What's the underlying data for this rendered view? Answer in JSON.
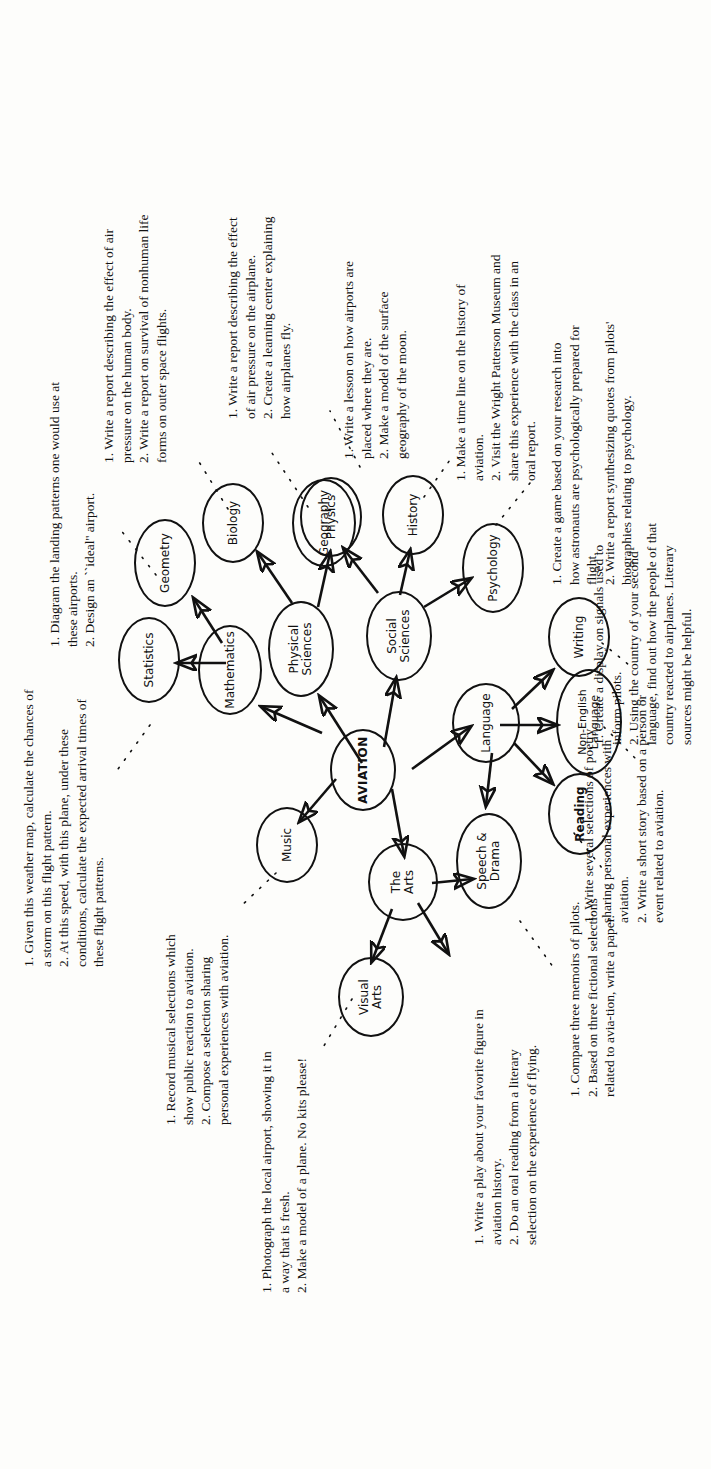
{
  "diagram": {
    "type": "concept-map",
    "title": "AVIATION",
    "center_node": "AVIATION",
    "nodes": [
      {
        "id": "aviation",
        "label": "AVIATION",
        "level": "center"
      },
      {
        "id": "the-arts",
        "label": "The\nArts",
        "level": "major"
      },
      {
        "id": "language",
        "label": "Language",
        "level": "major"
      },
      {
        "id": "social-sciences",
        "label": "Social\nSciences",
        "level": "major"
      },
      {
        "id": "physical-sciences",
        "label": "Physical\nSciences",
        "level": "major"
      },
      {
        "id": "mathematics",
        "label": "Mathematics",
        "level": "major"
      },
      {
        "id": "music",
        "label": "Music",
        "level": "leaf"
      },
      {
        "id": "visual-arts",
        "label": "Visual\nArts",
        "level": "leaf"
      },
      {
        "id": "speech-drama",
        "label": "Speech &\nDrama",
        "level": "leaf"
      },
      {
        "id": "reading",
        "label": "Reading",
        "level": "leaf"
      },
      {
        "id": "writing",
        "label": "Writing",
        "level": "leaf"
      },
      {
        "id": "non-english",
        "label": "Non-English\nLanguage",
        "level": "leaf"
      },
      {
        "id": "psychology",
        "label": "Psychology",
        "level": "leaf"
      },
      {
        "id": "history",
        "label": "History",
        "level": "leaf"
      },
      {
        "id": "geography",
        "label": "Geography",
        "level": "leaf"
      },
      {
        "id": "biology",
        "label": "Biology",
        "level": "leaf"
      },
      {
        "id": "physics",
        "label": "Physics",
        "level": "leaf"
      },
      {
        "id": "statistics",
        "label": "Statistics",
        "level": "leaf"
      },
      {
        "id": "geometry",
        "label": "Geometry",
        "level": "leaf"
      }
    ],
    "edges": [
      {
        "from": "aviation",
        "to": "the-arts"
      },
      {
        "from": "aviation",
        "to": "language"
      },
      {
        "from": "aviation",
        "to": "social-sciences"
      },
      {
        "from": "aviation",
        "to": "physical-sciences"
      },
      {
        "from": "aviation",
        "to": "mathematics"
      },
      {
        "from": "the-arts",
        "to": "music"
      },
      {
        "from": "the-arts",
        "to": "visual-arts"
      },
      {
        "from": "the-arts",
        "to": "speech-drama"
      },
      {
        "from": "language",
        "to": "speech-drama"
      },
      {
        "from": "language",
        "to": "reading"
      },
      {
        "from": "language",
        "to": "writing"
      },
      {
        "from": "language",
        "to": "non-english"
      },
      {
        "from": "social-sciences",
        "to": "psychology"
      },
      {
        "from": "social-sciences",
        "to": "history"
      },
      {
        "from": "social-sciences",
        "to": "geography"
      },
      {
        "from": "physical-sciences",
        "to": "biology"
      },
      {
        "from": "physical-sciences",
        "to": "physics"
      },
      {
        "from": "mathematics",
        "to": "statistics"
      },
      {
        "from": "mathematics",
        "to": "geometry"
      }
    ]
  },
  "notes": {
    "visual_arts": "1. Photograph the local airport, showing it in a way that is fresh.\n2. Make a model of a plane. No kits please!",
    "music": "1. Record musical selections which show public reaction to aviation.\n2. Compose a selection sharing personal experiences with aviation.",
    "mathematics": "1. Given this weather map, calculate the chances of a storm on this flight pattern.\n2. At this speed, with this plane, under these conditions, calculate the expected arrival times of these flight patterns.",
    "geography": "1. Diagram the landing patterns one would use at these airports.\n2. Design an ``ideal'' airport.",
    "biology": "1. Write a report describing the effect of air pressure on the human body.\n2. Write a report on survival of nonhuman life forms on outer space flights.",
    "physics": "1. Write a report describing the effect of air pressure on the airplane.\n2. Create a learning center explaining how airplanes fly.",
    "social_studies": "1. Write a lesson on how airports are placed where they are.\n2. Make a model of the surface geography of the moon.",
    "history": "1. Make a time line on the history of aviation.\n2. Visit the Wright Patterson Museum and share this experience with the class in an oral report.",
    "psychology": "1. Create a game based on your research into how astronauts are psychologically prepared for flight.\n2. Write a report synthesizing quotes from pilots' biographies relating to psychology.",
    "speech_drama": "1. Write a play about your favorite figure in aviation history.\n2. Do an oral reading from a literary selection on the experience of flying.",
    "reading": "1. Compare three memoirs of pilots.\n2. Based on three fictional selections related to avia-tion, write a paper.",
    "writing": "1. Write several selections of poetry sharing personal experiences with aviation.\n2. Write a short story based on a person or event related to aviation.",
    "non_english": "1. Create a display on signals used to inform pilots.\n2. Using the country of your second language, find out how the people of that country reacted to airplanes. Literary sources might be helpful."
  }
}
